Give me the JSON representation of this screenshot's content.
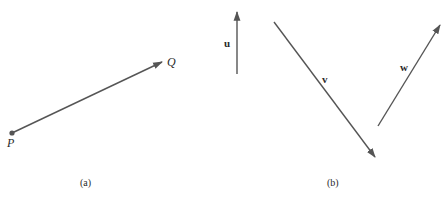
{
  "colors": {
    "stroke": "#555555",
    "text": "#2a2a2a"
  },
  "panel_a": {
    "caption": "(a)",
    "vector": {
      "start_label": "P",
      "end_label": "Q",
      "start": [
        12,
        133
      ],
      "end": [
        162,
        62
      ]
    }
  },
  "panel_b": {
    "caption": "(b)",
    "vectors": [
      {
        "label": "u",
        "start": [
          237,
          74
        ],
        "end": [
          237,
          11
        ]
      },
      {
        "label": "v",
        "start": [
          274,
          22
        ],
        "end": [
          376,
          158
        ]
      },
      {
        "label": "w",
        "start": [
          378,
          126
        ],
        "end": [
          441,
          24
        ]
      }
    ]
  }
}
